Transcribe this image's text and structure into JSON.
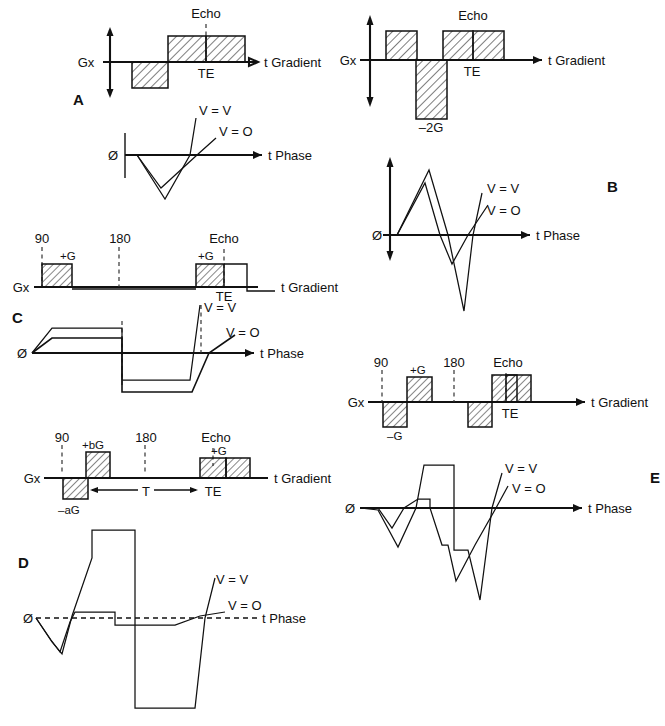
{
  "figure": {
    "axis_labels": {
      "gradient_axis": "t Gradient",
      "phase_axis": "t Phase",
      "gx": "Gx",
      "phi": "Ø"
    },
    "common_labels": {
      "echo": "Echo",
      "te": "TE",
      "rf90": "90",
      "rf180": "180",
      "v_equals_v": "V = V",
      "v_equals_o": "V = O"
    }
  },
  "panels": [
    {
      "id": "A",
      "letter": "A",
      "gradient": {
        "gx": "Gx",
        "axis": "t Gradient",
        "echo": "Echo",
        "te": "TE",
        "lobes": [
          {
            "sign": "negative",
            "amplitude": -1,
            "hatched": true
          },
          {
            "sign": "positive",
            "amplitude": 1,
            "hatched": true
          }
        ]
      },
      "phase": {
        "phi": "Ø",
        "axis": "t Phase",
        "curves": [
          {
            "name": "V = V",
            "label": "V = V"
          },
          {
            "name": "V = O",
            "label": "V = O"
          }
        ]
      }
    },
    {
      "id": "B",
      "letter": "B",
      "gradient": {
        "gx": "Gx",
        "axis": "t Gradient",
        "echo": "Echo",
        "te": "TE",
        "lobes": [
          {
            "sign": "positive",
            "amplitude": 1,
            "hatched": true,
            "label": ""
          },
          {
            "sign": "negative",
            "amplitude": -2,
            "hatched": true,
            "label": "–2G"
          },
          {
            "sign": "positive",
            "amplitude": 1,
            "hatched": true,
            "label": ""
          }
        ],
        "amplitude_label": "–2G"
      },
      "phase": {
        "phi": "Ø",
        "axis": "t Phase",
        "curves": [
          {
            "name": "V = V",
            "label": "V = V"
          },
          {
            "name": "V = O",
            "label": "V = O"
          }
        ]
      }
    },
    {
      "id": "C",
      "letter": "C",
      "gradient": {
        "gx": "Gx",
        "axis": "t Gradient",
        "rf90": "90",
        "rf180": "180",
        "echo": "Echo",
        "te": "TE",
        "lobes": [
          {
            "sign": "positive",
            "amplitude": 1,
            "hatched": true,
            "label": "+G"
          },
          {
            "sign": "positive",
            "amplitude": 1,
            "hatched": true,
            "label": "+G"
          }
        ]
      },
      "phase": {
        "phi": "Ø",
        "axis": "t Phase",
        "curves": [
          {
            "name": "V = V",
            "label": "V = V"
          },
          {
            "name": "V = O",
            "label": "V = O"
          }
        ]
      }
    },
    {
      "id": "D",
      "letter": "D",
      "gradient": {
        "gx": "Gx",
        "axis": "t Gradient",
        "rf90": "90",
        "rf180": "180",
        "echo": "Echo",
        "te": "TE",
        "interval": "T",
        "lobes": [
          {
            "sign": "negative",
            "amplitude": -1,
            "hatched": true,
            "label": "–aG"
          },
          {
            "sign": "positive",
            "amplitude": 1.6,
            "hatched": true,
            "label": "+bG"
          },
          {
            "sign": "positive",
            "amplitude": 1,
            "hatched": true,
            "label": "+G"
          }
        ]
      },
      "phase": {
        "phi": "Ø",
        "axis": "t Phase",
        "curves": [
          {
            "name": "V = V",
            "label": "V = V"
          },
          {
            "name": "V = O",
            "label": "V = O"
          }
        ]
      }
    },
    {
      "id": "E",
      "letter": "E",
      "gradient": {
        "gx": "Gx",
        "axis": "t Gradient",
        "rf90": "90",
        "rf180": "180",
        "echo": "Echo",
        "te": "TE",
        "lobes": [
          {
            "sign": "negative",
            "amplitude": -1,
            "hatched": true,
            "label": "–G"
          },
          {
            "sign": "positive",
            "amplitude": 1,
            "hatched": true,
            "label": "+G"
          },
          {
            "sign": "negative",
            "amplitude": -1,
            "hatched": true,
            "label": ""
          },
          {
            "sign": "positive",
            "amplitude": 1.3,
            "hatched": true,
            "label": ""
          }
        ]
      },
      "phase": {
        "phi": "Ø",
        "axis": "t Phase",
        "curves": [
          {
            "name": "V = V",
            "label": "V = V"
          },
          {
            "name": "V = O",
            "label": "V = O"
          }
        ]
      }
    }
  ]
}
